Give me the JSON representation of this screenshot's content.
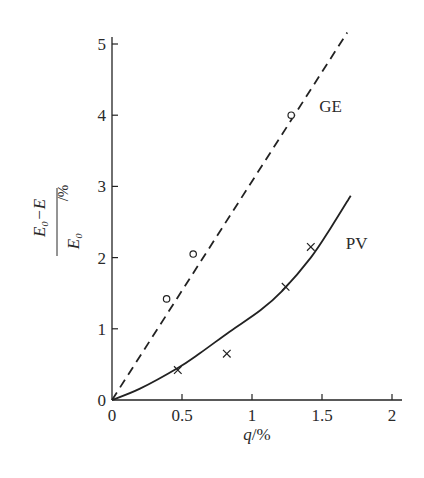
{
  "chart_data": {
    "type": "line",
    "title": "",
    "xlabel": "q/%",
    "xlabel_parts": {
      "var": "q",
      "unit": "/%"
    },
    "ylabel": "(E0−E)/E0 /%",
    "ylabel_parts": {
      "numerator": "E₀−E",
      "denominator": "E₀",
      "unit": "/%"
    },
    "xlim": [
      0,
      2
    ],
    "ylim": [
      0,
      5
    ],
    "xticks": [
      0,
      0.5,
      1,
      1.5,
      2
    ],
    "xtick_labels": [
      "0",
      "0.5",
      "1",
      "1.5",
      "2"
    ],
    "yticks": [
      0,
      1,
      2,
      3,
      4,
      5
    ],
    "ytick_labels": [
      "0",
      "1",
      "2",
      "3",
      "4",
      "5"
    ],
    "grid": false,
    "legend": "inline labels next to curves",
    "series": [
      {
        "name": "GE",
        "line_style": "dashed",
        "marker": "open-circle",
        "fit_line": [
          [
            0,
            0
          ],
          [
            1.68,
            5.16
          ]
        ],
        "points": [
          {
            "x": 0.39,
            "y": 1.42
          },
          {
            "x": 0.58,
            "y": 2.05
          },
          {
            "x": 1.28,
            "y": 4.0
          }
        ],
        "label_pos": {
          "x": 1.48,
          "y": 4.05
        }
      },
      {
        "name": "PV",
        "line_style": "solid",
        "marker": "cross",
        "fit_curve": [
          [
            0,
            0
          ],
          [
            0.2,
            0.16
          ],
          [
            0.47,
            0.45
          ],
          [
            0.63,
            0.66
          ],
          [
            0.84,
            0.96
          ],
          [
            1.06,
            1.26
          ],
          [
            1.22,
            1.54
          ],
          [
            1.42,
            2.0
          ],
          [
            1.56,
            2.41
          ],
          [
            1.705,
            2.87
          ]
        ],
        "points": [
          {
            "x": 0.47,
            "y": 0.42
          },
          {
            "x": 0.82,
            "y": 0.65
          },
          {
            "x": 1.24,
            "y": 1.59
          },
          {
            "x": 1.42,
            "y": 2.15
          }
        ],
        "label_pos": {
          "x": 1.67,
          "y": 2.12
        }
      }
    ]
  },
  "layout": {
    "origin_px": [
      112,
      400
    ],
    "x_unit_px": 140,
    "y_unit_px": 71.2,
    "x_axis_end_px": 402,
    "y_axis_top_px": 37,
    "line_color": "#222222"
  }
}
